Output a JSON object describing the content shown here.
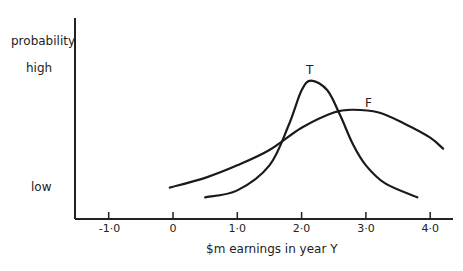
{
  "chart_data": {
    "type": "line",
    "title": "",
    "xlabel": "$m earnings in year  Y",
    "ylabel": "probability",
    "y_tick_labels": {
      "high": "high",
      "low": "low"
    },
    "x_ticks": [
      -1.0,
      0,
      1.0,
      2.0,
      3.0,
      4.0
    ],
    "x_tick_labels": [
      "-1·0",
      "0",
      "1·0",
      "2·0",
      "3·0",
      "4·0"
    ],
    "xlim": [
      -1.5,
      4.3
    ],
    "ylim": [
      0,
      1
    ],
    "grid": false,
    "legend": "inline curve labels",
    "series": [
      {
        "name": "T",
        "x": [
          0.5,
          1.0,
          1.5,
          1.8,
          2.0,
          2.15,
          2.4,
          2.6,
          2.8,
          3.0,
          3.3,
          3.8
        ],
        "y": [
          0.12,
          0.17,
          0.35,
          0.64,
          0.89,
          0.96,
          0.89,
          0.71,
          0.5,
          0.35,
          0.22,
          0.12
        ]
      },
      {
        "name": "F",
        "x": [
          -0.05,
          0.5,
          1.0,
          1.5,
          2.0,
          2.5,
          2.8,
          3.2,
          3.6,
          4.0,
          4.2
        ],
        "y": [
          0.19,
          0.26,
          0.35,
          0.46,
          0.62,
          0.73,
          0.75,
          0.73,
          0.65,
          0.55,
          0.47
        ]
      }
    ],
    "annotations": [
      {
        "text": "T",
        "x": 2.1,
        "y": 1.04
      },
      {
        "text": "F",
        "x": 3.0,
        "y": 0.8
      }
    ]
  }
}
